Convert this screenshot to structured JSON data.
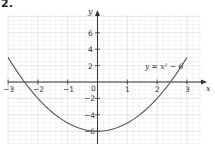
{
  "question_number": "2.",
  "chart_data": {
    "type": "line",
    "title": "",
    "xlabel": "x",
    "ylabel": "y",
    "xlim": [
      -3,
      3.35
    ],
    "ylim": [
      -7.5,
      8
    ],
    "grid": true,
    "x_ticks": [
      -3,
      -2,
      -1,
      0,
      1,
      2,
      3
    ],
    "x_tick_labels": [
      "−3",
      "−2",
      "−1",
      "0",
      "1",
      "2",
      "3"
    ],
    "y_ticks": [
      6,
      4,
      2,
      -2,
      -4,
      -6
    ],
    "y_tick_labels": [
      "6",
      "4",
      "2",
      "−2",
      "−4",
      "−6"
    ],
    "series": [
      {
        "name": "y = x² − 6",
        "equation": "y = x^2 - 6",
        "x": [
          -3,
          -2.5,
          -2,
          -1.5,
          -1,
          -0.5,
          0,
          0.5,
          1,
          1.5,
          2,
          2.5,
          3
        ],
        "values": [
          3,
          0.25,
          -2,
          -3.75,
          -5,
          -5.75,
          -6,
          -5.75,
          -5,
          -3.75,
          -2,
          0.25,
          3
        ],
        "color": "#555555"
      }
    ],
    "annotations": [
      {
        "text": "y = x² − 6",
        "x": 1.6,
        "y": 1
      }
    ],
    "legend": "none"
  },
  "labels": {
    "x_axis": "x",
    "y_axis": "y",
    "origin": "0",
    "equation": "y = x² − 6",
    "x_ticks": [
      "−3",
      "−2",
      "−1",
      "1",
      "2",
      "3"
    ],
    "y_ticks": [
      "6",
      "4",
      "2",
      "−2",
      "−4",
      "−6"
    ]
  },
  "colors": {
    "grid_minor": "#ececec",
    "grid_major": "#d4d4d4",
    "axis": "#333333",
    "curve": "#555555"
  }
}
